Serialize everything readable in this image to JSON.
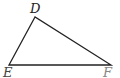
{
  "diagram": {
    "type": "triangle",
    "name": "triangle DEF",
    "vertices": [
      {
        "label": "D",
        "x": 35,
        "y": 17
      },
      {
        "label": "E",
        "x": 9,
        "y": 65
      },
      {
        "label": "F",
        "x": 111,
        "y": 65
      }
    ],
    "labels": {
      "d": "D",
      "e": "E",
      "f": "F"
    },
    "colors": {
      "stroke": "#222222",
      "label_d": "#222222",
      "label_e": "#444444",
      "label_f": "#888888"
    }
  }
}
